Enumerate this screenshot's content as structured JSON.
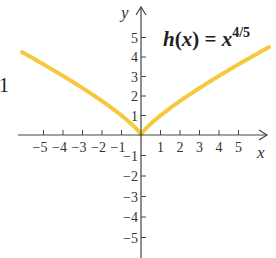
{
  "chart_data": {
    "type": "line",
    "title_parts": {
      "func": "h",
      "open": "(",
      "var": "x",
      "close": ")",
      "eq": " = ",
      "base": "x",
      "exponent": "4/5"
    },
    "xlabel": "x",
    "ylabel": "y",
    "xlim": [
      -6.1,
      6.6
    ],
    "ylim": [
      -5.5,
      5.7
    ],
    "grid": false,
    "legend": null,
    "x_ticks": [
      -5,
      -4,
      -3,
      -2,
      -1,
      1,
      2,
      3,
      4,
      5
    ],
    "x_tick_labels": [
      "−5",
      "−4",
      "−3",
      "−2",
      "−1",
      "1",
      "2",
      "3",
      "4",
      "5"
    ],
    "y_ticks": [
      5,
      4,
      3,
      2,
      1,
      -1,
      -2,
      -3,
      -4,
      -5
    ],
    "y_tick_labels": [
      "5",
      "4",
      "3",
      "2",
      "1",
      "−1",
      "−2",
      "−3",
      "−4",
      "−5"
    ],
    "series": [
      {
        "name": "h(x) = x^(4/5)",
        "color": "#F6C83E",
        "x": [
          -6.1,
          -5,
          -4,
          -3,
          -2,
          -1,
          -0.5,
          0,
          0.5,
          1,
          2,
          3,
          4,
          5,
          6,
          6.56
        ],
        "y": [
          4.25,
          3.62,
          3.03,
          2.41,
          1.74,
          1.0,
          0.57,
          0,
          0.57,
          1.0,
          1.74,
          2.41,
          3.03,
          3.62,
          4.19,
          4.5
        ]
      }
    ],
    "annotations": [
      {
        "text": "1",
        "note": "clipped margin label at left edge"
      }
    ]
  },
  "colors": {
    "curve": "#F6C83E",
    "axis": "#444444",
    "text": "#333333"
  },
  "layout": {
    "origin_px": [
      141,
      135
    ],
    "unit_x_px": 19.5,
    "unit_y_up_px": 19.5,
    "unit_y_down_px": 20.5
  },
  "stray_label": "1"
}
